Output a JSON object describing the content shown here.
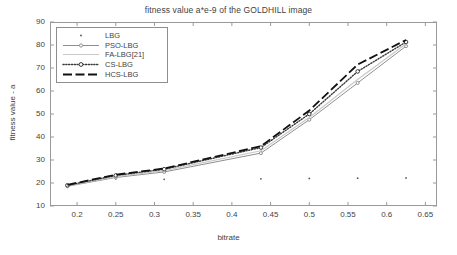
{
  "chart_data": {
    "type": "line",
    "title": "fitness value a*e-9 of the GOLDHILL image",
    "xlabel": "bitrate",
    "ylabel": "fitness value - a",
    "xlim": [
      0.165,
      0.665
    ],
    "ylim": [
      10,
      90
    ],
    "xticks": [
      0.2,
      0.25,
      0.3,
      0.35,
      0.4,
      0.45,
      0.5,
      0.55,
      0.6,
      0.65
    ],
    "xtick_labels": [
      "0.2",
      "0.25",
      "0.3",
      "0.35",
      "0.4",
      "0.45",
      "0.5",
      "0.55",
      "0.6",
      "0.65"
    ],
    "yticks": [
      10,
      20,
      30,
      40,
      50,
      60,
      70,
      80,
      90
    ],
    "ytick_labels": [
      "10",
      "20",
      "30",
      "40",
      "50",
      "60",
      "70",
      "80",
      "90"
    ],
    "grid": false,
    "legend_position": "upper left",
    "x": [
      0.1875,
      0.25,
      0.3125,
      0.4375,
      0.5,
      0.5625,
      0.625
    ],
    "series": [
      {
        "name": "LBG",
        "style": "markers-only",
        "color": "#555555",
        "values": [
          18.5,
          21.8,
          21.6,
          21.8,
          22.0,
          22.1,
          22.2
        ]
      },
      {
        "name": "PSO-LBG",
        "style": "solid-thin-with-markers",
        "color": "#8f8f8f",
        "values": [
          18.6,
          22.4,
          24.8,
          33.0,
          47.5,
          63.5,
          79.5
        ]
      },
      {
        "name": "FA-LBG[21]",
        "style": "solid-light",
        "color": "#c9c9c9",
        "values": [
          18.8,
          22.8,
          25.4,
          34.0,
          48.5,
          65.0,
          80.5
        ]
      },
      {
        "name": "CS-LBG",
        "style": "dotted-with-markers",
        "color": "#3a3a3a",
        "values": [
          19.0,
          23.3,
          26.0,
          35.4,
          50.0,
          68.5,
          81.3
        ]
      },
      {
        "name": "HCS-LBG",
        "style": "dashed-thick",
        "color": "#111111",
        "values": [
          19.2,
          23.6,
          26.3,
          36.0,
          51.5,
          71.5,
          82.2
        ]
      }
    ],
    "legend_entries": [
      {
        "label": "LBG",
        "sample": "dot"
      },
      {
        "label": "PSO-LBG",
        "sample": "solid-marker"
      },
      {
        "label": "FA-LBG[21]",
        "sample": "solid-light"
      },
      {
        "label": "CS-LBG",
        "sample": "dotted-marker"
      },
      {
        "label": "HCS-LBG",
        "sample": "dashed-thick"
      }
    ]
  },
  "colors": {
    "frame": "#9a9a9a",
    "text": "#3f3f3f",
    "background": "#ffffff"
  }
}
